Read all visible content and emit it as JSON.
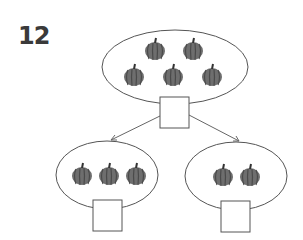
{
  "problem": {
    "number": "12",
    "type": "number-bond",
    "colors": {
      "line": "#555555",
      "pumpkin": "#6e6e6e",
      "pumpkin_dark": "#4a4a4a",
      "number": "#3a3a3a"
    },
    "whole": {
      "label": "whole",
      "pumpkin_count": 5,
      "answer_box": ""
    },
    "parts": [
      {
        "label": "part-left",
        "pumpkin_count": 3,
        "answer_box": ""
      },
      {
        "label": "part-right",
        "pumpkin_count": 2,
        "answer_box": ""
      }
    ]
  }
}
